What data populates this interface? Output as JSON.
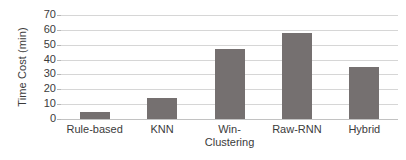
{
  "chart_data": {
    "type": "bar",
    "title": "",
    "subtitle": "",
    "xlabel": "",
    "ylabel": "Time Cost (min)",
    "categories": [
      "Rule-based",
      "KNN",
      "Win-\nClustering",
      "Raw-RNN",
      "Hybrid"
    ],
    "values": [
      5,
      14,
      47,
      58,
      35
    ],
    "ylim": [
      0,
      70
    ],
    "ytick_labels": [
      "70",
      "60",
      "50",
      "40",
      "30",
      "20",
      "10",
      "0"
    ],
    "ytick_values": [
      70,
      60,
      50,
      40,
      30,
      20,
      10,
      0
    ],
    "grid": true,
    "legend": false,
    "legend_position": "none",
    "series": [
      {
        "name": "Time Cost",
        "values": [
          5,
          14,
          47,
          58,
          35
        ]
      }
    ],
    "colors": {
      "bar": "#757070",
      "gridline": "#d6d6d6",
      "baseline": "#c2c2c2",
      "text": "#3b3b3b",
      "background": "#ffffff"
    }
  }
}
